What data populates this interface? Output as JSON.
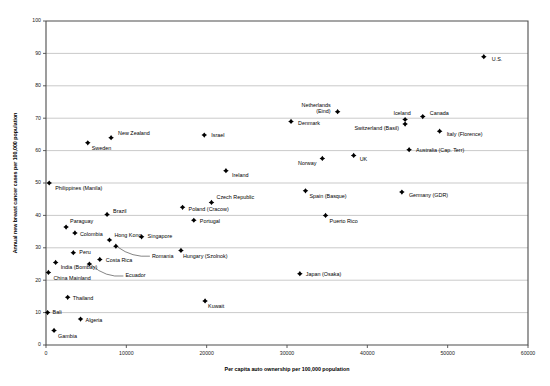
{
  "chart_data": {
    "type": "scatter",
    "title": "",
    "xlabel": "Per capita auto ownership per 100,000 population",
    "ylabel": "Annual new breast cancer cases per 100,000 population",
    "xlim": [
      0,
      60000
    ],
    "ylim": [
      0,
      100
    ],
    "xticks": [
      0,
      10000,
      20000,
      30000,
      40000,
      50000,
      60000
    ],
    "xticklabels": [
      "0",
      "10000",
      "20000",
      "30000",
      "40000",
      "50000",
      "60000"
    ],
    "yticks": [
      0,
      10,
      20,
      30,
      40,
      50,
      60,
      70,
      80,
      90,
      100
    ],
    "yticklabels": [
      "0",
      "10",
      "20",
      "30",
      "40",
      "50",
      "60",
      "70",
      "80",
      "90",
      "100"
    ],
    "grid": "horizontal",
    "legend": "none",
    "marker_color": "#000000",
    "grid_color": "#b3b3b3",
    "axis_color": "#4d4d4d",
    "points": [
      {
        "label": "U.S.",
        "x": 54500,
        "y": 89.0,
        "lx": 8,
        "ly": 3,
        "anchor": "start",
        "leader": false
      },
      {
        "label": "Netherlands (Eind)",
        "x": 36300,
        "y": 72.0,
        "lx": -7,
        "ly": -6,
        "anchor": "end",
        "leader": false,
        "line2": true
      },
      {
        "label": "Canada",
        "x": 46900,
        "y": 70.5,
        "lx": 7,
        "ly": -3,
        "anchor": "start",
        "leader": false
      },
      {
        "label": "Iceland",
        "x": 44700,
        "y": 69.6,
        "lx": -3,
        "ly": -6,
        "anchor": "middle",
        "leader": false
      },
      {
        "label": "Denmark",
        "x": 30500,
        "y": 69.0,
        "lx": 7,
        "ly": 2,
        "anchor": "start",
        "leader": false
      },
      {
        "label": "Switzerland (Basil)",
        "x": 44700,
        "y": 68.2,
        "lx": -6,
        "ly": 5,
        "anchor": "end",
        "leader": false
      },
      {
        "label": "Italy (Florence)",
        "x": 49000,
        "y": 66.0,
        "lx": 7,
        "ly": 3,
        "anchor": "start",
        "leader": false
      },
      {
        "label": "Israel",
        "x": 19700,
        "y": 64.8,
        "lx": 7,
        "ly": 1,
        "anchor": "start",
        "leader": false
      },
      {
        "label": "New Zealand",
        "x": 8100,
        "y": 64.0,
        "lx": 7,
        "ly": -4,
        "anchor": "start",
        "leader": false
      },
      {
        "label": "Sweden",
        "x": 5200,
        "y": 62.4,
        "lx": 4,
        "ly": 6,
        "anchor": "start",
        "leader": false
      },
      {
        "label": "Australia (Cap. Terr)",
        "x": 45200,
        "y": 60.3,
        "lx": 7,
        "ly": 1,
        "anchor": "start",
        "leader": false
      },
      {
        "label": "UK",
        "x": 38300,
        "y": 58.5,
        "lx": 6,
        "ly": 4,
        "anchor": "start",
        "leader": false
      },
      {
        "label": "Norway",
        "x": 34400,
        "y": 57.6,
        "lx": -6,
        "ly": 5,
        "anchor": "end",
        "leader": false
      },
      {
        "label": "Ireland",
        "x": 22400,
        "y": 53.8,
        "lx": 6,
        "ly": 5,
        "anchor": "start",
        "leader": false
      },
      {
        "label": "Philippines (Manila)",
        "x": 400,
        "y": 50.0,
        "lx": 6,
        "ly": 6,
        "anchor": "start",
        "leader": false
      },
      {
        "label": "Spain (Basque)",
        "x": 32300,
        "y": 47.6,
        "lx": 4,
        "ly": 6,
        "anchor": "start",
        "leader": false
      },
      {
        "label": "Germany (GDR)",
        "x": 44300,
        "y": 47.2,
        "lx": 7,
        "ly": 4,
        "anchor": "start",
        "leader": false
      },
      {
        "label": "Czech Republic",
        "x": 20600,
        "y": 44.0,
        "lx": 5,
        "ly": -5,
        "anchor": "start",
        "leader": false
      },
      {
        "label": "Poland (Cracow)",
        "x": 17000,
        "y": 42.5,
        "lx": 6,
        "ly": 2,
        "anchor": "start",
        "leader": false
      },
      {
        "label": "Brazil",
        "x": 7600,
        "y": 40.3,
        "lx": 6,
        "ly": -3,
        "anchor": "start",
        "leader": false
      },
      {
        "label": "Puerto Rico",
        "x": 34800,
        "y": 40.0,
        "lx": 4,
        "ly": 6,
        "anchor": "start",
        "leader": false
      },
      {
        "label": "Portugal",
        "x": 18400,
        "y": 38.5,
        "lx": 6,
        "ly": 1,
        "anchor": "start",
        "leader": false
      },
      {
        "label": "Paraguay",
        "x": 2500,
        "y": 36.4,
        "lx": 4,
        "ly": -5,
        "anchor": "start",
        "leader": false
      },
      {
        "label": "Colombia",
        "x": 3600,
        "y": 34.6,
        "lx": 5,
        "ly": 2,
        "anchor": "start",
        "leader": false
      },
      {
        "label": "Singapore",
        "x": 11900,
        "y": 33.4,
        "lx": 6,
        "ly": 0,
        "anchor": "start",
        "leader": false
      },
      {
        "label": "Hong Kong",
        "x": 7900,
        "y": 32.4,
        "lx": 5,
        "ly": -4,
        "anchor": "start",
        "leader": false
      },
      {
        "label": "Hungary (Szolnok)",
        "x": 16800,
        "y": 29.2,
        "lx": 2,
        "ly": 6,
        "anchor": "start",
        "leader": false
      },
      {
        "label": "Romania",
        "x": 8700,
        "y": 30.5,
        "lx": 36,
        "ly": 10,
        "anchor": "start",
        "leader": true
      },
      {
        "label": "Peru",
        "x": 3400,
        "y": 28.5,
        "lx": 6,
        "ly": 0,
        "anchor": "start",
        "leader": false
      },
      {
        "label": "Costa Rica",
        "x": 6700,
        "y": 26.4,
        "lx": 6,
        "ly": 1,
        "anchor": "start",
        "leader": false
      },
      {
        "label": "India (Bombay)",
        "x": 1200,
        "y": 25.5,
        "lx": 5,
        "ly": 5,
        "anchor": "start",
        "leader": false
      },
      {
        "label": "Ecuador",
        "x": 5400,
        "y": 25.0,
        "lx": 36,
        "ly": 12,
        "anchor": "start",
        "leader": true
      },
      {
        "label": "China Mainland",
        "x": 300,
        "y": 22.4,
        "lx": 5,
        "ly": 6,
        "anchor": "start",
        "leader": false
      },
      {
        "label": "Japan (Osaka)",
        "x": 31600,
        "y": 22.0,
        "lx": 6,
        "ly": 1,
        "anchor": "start",
        "leader": false
      },
      {
        "label": "Thailand",
        "x": 2700,
        "y": 14.7,
        "lx": 5,
        "ly": 1,
        "anchor": "start",
        "leader": false
      },
      {
        "label": "Kuwait",
        "x": 19800,
        "y": 13.6,
        "lx": 3,
        "ly": 6,
        "anchor": "start",
        "leader": false
      },
      {
        "label": "Bali",
        "x": 200,
        "y": 10.0,
        "lx": 5,
        "ly": 0,
        "anchor": "start",
        "leader": false
      },
      {
        "label": "Algeria",
        "x": 4300,
        "y": 8.0,
        "lx": 5,
        "ly": 1,
        "anchor": "start",
        "leader": false
      },
      {
        "label": "Gambia",
        "x": 1000,
        "y": 4.5,
        "lx": 4,
        "ly": 6,
        "anchor": "start",
        "leader": false
      }
    ]
  }
}
